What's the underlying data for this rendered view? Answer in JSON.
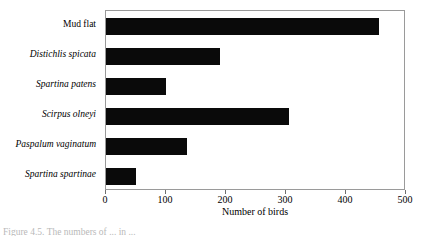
{
  "figure": {
    "caption": "Figure 4.5.  The numbers of ... in ..."
  },
  "chart_data": {
    "type": "bar",
    "orientation": "horizontal",
    "title": "",
    "subtitle": "",
    "xlabel": "Number of birds",
    "ylabel": "",
    "categories": [
      "Mud flat",
      "Distichlis spicata",
      "Spartina patens",
      "Scirpus olneyi",
      "Paspalum vaginatum",
      "Spartina spartinae"
    ],
    "category_styles": [
      "normal",
      "italic",
      "italic",
      "italic",
      "italic",
      "italic"
    ],
    "values": [
      455,
      190,
      100,
      305,
      135,
      50
    ],
    "xlim": [
      0,
      500
    ],
    "xticks": [
      0,
      100,
      200,
      300,
      400,
      500
    ],
    "xtick_labels": [
      "0",
      "100",
      "200",
      "300",
      "400",
      "500"
    ],
    "grid": false,
    "legend": null,
    "bar_color": "#0a0a0a",
    "frame_color": "#9a9a9a",
    "background": "#ffffff"
  }
}
